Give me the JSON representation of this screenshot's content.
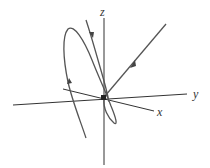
{
  "diagram": {
    "type": "3d-trajectory",
    "axes": {
      "x_label": "x",
      "y_label": "y",
      "z_label": "z"
    },
    "colors": {
      "axis": "#333333",
      "curve": "#555555",
      "background": "#ffffff"
    },
    "elements": [
      {
        "name": "incoming-straight-line",
        "description": "straight trajectory from upper right into origin",
        "arrow_direction": "toward origin"
      },
      {
        "name": "spiral-trajectory",
        "description": "looping curve spiraling around origin",
        "arrow_direction": "upward on left branch, downward on upper branch"
      }
    ]
  }
}
